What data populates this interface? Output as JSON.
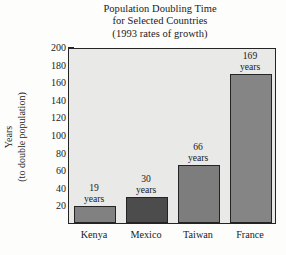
{
  "chart_data": {
    "type": "bar",
    "title": "Population Doubling Time\nfor Selected Countries\n(1993 rates of growth)",
    "title_lines": [
      "Population Doubling Time",
      "for Selected Countries",
      "(1993 rates of growth)"
    ],
    "categories": [
      "Kenya",
      "Mexico",
      "Taiwan",
      "France"
    ],
    "values": [
      19,
      30,
      66,
      169
    ],
    "value_labels": [
      "19 years",
      "30 years",
      "66 years",
      "169 years"
    ],
    "value_label_lines": [
      [
        "19",
        "years"
      ],
      [
        "30",
        "years"
      ],
      [
        "66",
        "years"
      ],
      [
        "169",
        "years"
      ]
    ],
    "xlabel": "",
    "ylabel": "Years (to double population)",
    "ylabel_lines": [
      "Years",
      "(to double population)"
    ],
    "ylim": [
      0,
      200
    ],
    "ytick_values": [
      20,
      40,
      60,
      80,
      100,
      120,
      140,
      160,
      180,
      200
    ],
    "ytick_labels": [
      "20",
      "40",
      "60",
      "80",
      "100",
      "120",
      "140",
      "160",
      "180",
      "200"
    ],
    "grid": false,
    "legend": false,
    "units": "years",
    "bar_colors": [
      "#818181",
      "#4c4c4c",
      "#7d7d7d",
      "#858585"
    ],
    "plot_background": "#e9e9e7",
    "axis_color": "#242424",
    "page_background": "#fdfdfc"
  }
}
